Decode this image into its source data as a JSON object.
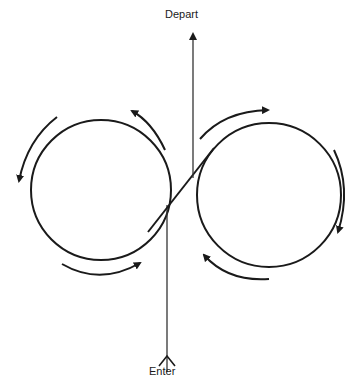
{
  "diagram": {
    "type": "figure-eight holding pattern",
    "labels": {
      "depart": "Depart",
      "enter": "Enter"
    },
    "circles": [
      {
        "name": "left-loop",
        "cx": 101,
        "cy": 190,
        "r": 70,
        "direction": "counterclockwise"
      },
      {
        "name": "right-loop",
        "cx": 269,
        "cy": 195,
        "r": 72,
        "direction": "clockwise"
      }
    ],
    "paths": {
      "enter_line": {
        "x": 167,
        "y_from": 378,
        "y_to": 205
      },
      "crossing_diagonal": {
        "from": [
          150,
          228
        ],
        "to": [
          212,
          150
        ]
      },
      "depart_line": {
        "x": 193,
        "y_from": 175,
        "y_to": 28
      }
    },
    "colors": {
      "stroke": "#1a1a1a",
      "background": "#ffffff"
    }
  }
}
